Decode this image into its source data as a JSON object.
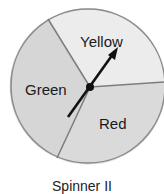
{
  "spinner": {
    "caption": "Spinner II",
    "sections": [
      {
        "label": "Yellow",
        "color": "#ececec"
      },
      {
        "label": "Green",
        "color": "#d9d9d9"
      },
      {
        "label": "Red",
        "color": "#dadada"
      }
    ],
    "outline_color": "#8a8a8a",
    "arrow_color": "#111111"
  }
}
